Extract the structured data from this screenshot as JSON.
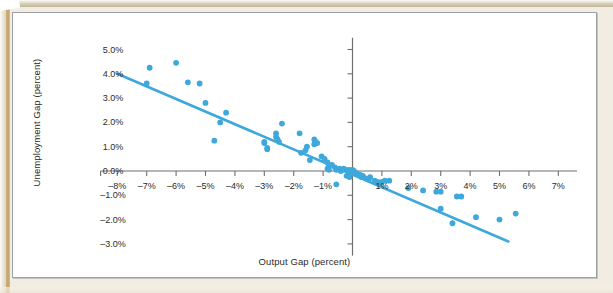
{
  "figure": {
    "background_color": "#ffffff",
    "page_color": "#f1ede2",
    "frame_color": "#9aa0a4"
  },
  "chart_data": {
    "type": "scatter",
    "title": "",
    "xlabel": "Output Gap (percent)",
    "ylabel": "Unemployment Gap (percent)",
    "xlim": [
      -8.5,
      7.5
    ],
    "ylim": [
      -3.4,
      5.4
    ],
    "xtick_labels": [
      "–8%",
      "–7%",
      "–6%",
      "–5%",
      "–4%",
      "–3%",
      "–2%",
      "–1%",
      "1%",
      "2%",
      "3%",
      "4%",
      "5%",
      "6%",
      "7%"
    ],
    "xticks": [
      -8,
      -7,
      -6,
      -5,
      -4,
      -3,
      -2,
      -1,
      1,
      2,
      3,
      4,
      5,
      6,
      7
    ],
    "ytick_labels": [
      "5.0%",
      "4.0%",
      "3.0%",
      "2.0%",
      "1.0%",
      "0.0%",
      "–1.0%",
      "–2.0%",
      "–3.0%"
    ],
    "yticks": [
      5,
      4,
      3,
      2,
      1,
      0,
      -1,
      -2,
      -3
    ],
    "grid": false,
    "legend": "none",
    "marker_color": "#3ea8dc",
    "line_color": "#3ea8dc",
    "axis_color": "#6f6f6f",
    "trendline": {
      "label": "fitted line",
      "x_start": -8.0,
      "y_start": 4.0,
      "x_end": 5.3,
      "y_end": -2.9
    },
    "series": [
      {
        "name": "Output gap vs unemployment gap",
        "points": [
          [
            -6.9,
            4.25
          ],
          [
            -6.0,
            4.45
          ],
          [
            -7.0,
            3.6
          ],
          [
            -5.6,
            3.65
          ],
          [
            -5.2,
            3.6
          ],
          [
            -5.0,
            2.8
          ],
          [
            -4.3,
            2.4
          ],
          [
            -4.5,
            2.0
          ],
          [
            -4.7,
            1.25
          ],
          [
            -2.4,
            1.95
          ],
          [
            -2.6,
            1.55
          ],
          [
            -2.6,
            1.4
          ],
          [
            -2.55,
            1.3
          ],
          [
            -2.5,
            1.2
          ],
          [
            -3.0,
            1.2
          ],
          [
            -3.0,
            1.15
          ],
          [
            -2.9,
            0.95
          ],
          [
            -2.9,
            0.9
          ],
          [
            -1.8,
            1.55
          ],
          [
            -1.55,
            1.0
          ],
          [
            -1.6,
            0.85
          ],
          [
            -1.75,
            0.75
          ],
          [
            -1.3,
            1.3
          ],
          [
            -1.25,
            1.2
          ],
          [
            -1.2,
            1.15
          ],
          [
            -1.3,
            1.1
          ],
          [
            -1.45,
            0.45
          ],
          [
            -1.05,
            0.6
          ],
          [
            -0.95,
            0.5
          ],
          [
            -0.85,
            0.35
          ],
          [
            -0.8,
            0.2
          ],
          [
            -0.85,
            0.1
          ],
          [
            -0.8,
            0.05
          ],
          [
            -0.7,
            0.25
          ],
          [
            -0.6,
            0.15
          ],
          [
            -0.55,
            0.05
          ],
          [
            -0.45,
            0.1
          ],
          [
            -0.4,
            0.0
          ],
          [
            -0.35,
            0.05
          ],
          [
            -0.3,
            0.1
          ],
          [
            -0.2,
            0.05
          ],
          [
            -0.15,
            0.0
          ],
          [
            -0.1,
            0.05
          ],
          [
            -0.05,
            0.0
          ],
          [
            0.0,
            0.05
          ],
          [
            0.05,
            0.0
          ],
          [
            -0.55,
            -0.55
          ],
          [
            -0.2,
            -0.2
          ],
          [
            -0.1,
            -0.25
          ],
          [
            0.15,
            -0.1
          ],
          [
            0.25,
            -0.15
          ],
          [
            0.3,
            -0.25
          ],
          [
            0.35,
            -0.2
          ],
          [
            0.45,
            -0.3
          ],
          [
            0.55,
            -0.35
          ],
          [
            0.6,
            -0.25
          ],
          [
            0.75,
            -0.4
          ],
          [
            0.85,
            -0.45
          ],
          [
            0.95,
            -0.5
          ],
          [
            1.0,
            -0.45
          ],
          [
            1.1,
            -0.4
          ],
          [
            1.25,
            -0.4
          ],
          [
            1.9,
            -0.7
          ],
          [
            2.4,
            -0.8
          ],
          [
            2.85,
            -0.85
          ],
          [
            3.0,
            -0.85
          ],
          [
            3.0,
            -1.55
          ],
          [
            3.4,
            -2.15
          ],
          [
            3.55,
            -1.05
          ],
          [
            3.7,
            -1.05
          ],
          [
            4.2,
            -1.9
          ],
          [
            5.0,
            -2.0
          ],
          [
            5.55,
            -1.75
          ]
        ]
      }
    ]
  }
}
